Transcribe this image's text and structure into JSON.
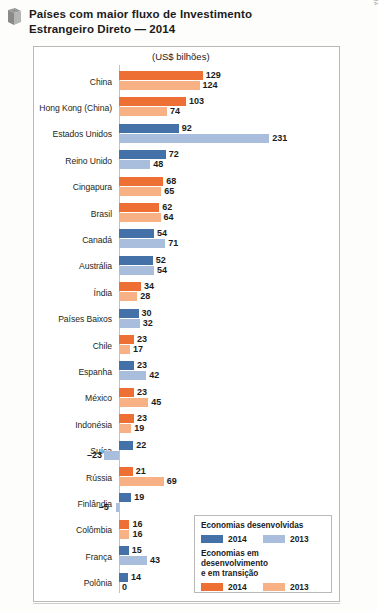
{
  "header": {
    "icon": "flag-bookmark-icon",
    "title_line1": "Países com maior fluxo de Investimento",
    "title_line2": "Estrangeiro Direto — 2014"
  },
  "credit": "FERNANDO JOSÉ FERREIRA",
  "colors": {
    "series_2014_developed": "#4472a8",
    "series_2013_developed": "#a9bedd",
    "series_2014_emerging": "#ed6f33",
    "series_2013_emerging": "#f8b185",
    "frame": "#b9b9b9",
    "axis": "#c2c2c2",
    "text": "#231f20"
  },
  "legend": {
    "group_developed": {
      "title": "Economias desenvolvidas",
      "items": [
        {
          "label": "2014",
          "color": "#4472a8"
        },
        {
          "label": "2013",
          "color": "#a9bedd"
        }
      ]
    },
    "group_emerging": {
      "title_line1": "Economias em desenvolvimento",
      "title_line2": "e em transição",
      "items": [
        {
          "label": "2014",
          "color": "#ed6f33"
        },
        {
          "label": "2013",
          "color": "#f8b185"
        }
      ]
    }
  },
  "chart_data": {
    "type": "bar",
    "orientation": "horizontal",
    "title": "Países com maior fluxo de Investimento Estrangeiro Direto — 2014",
    "units_caption": "(US$ bilhões)",
    "xlabel": "",
    "ylabel": "",
    "grid": false,
    "legend_position": "bottom-right",
    "xlim": [
      -23,
      231
    ],
    "axis_origin_value": 0,
    "px_per_unit": 0.65,
    "categories": [
      "China",
      "Hong Kong (China)",
      "Estados Unidos",
      "Reino Unido",
      "Cingapura",
      "Brasil",
      "Canadá",
      "Austrália",
      "Índia",
      "Países Baixos",
      "Chile",
      "Espanha",
      "México",
      "Indonésia",
      "Suíça",
      "Rússia",
      "Finlândia",
      "Colômbia",
      "França",
      "Polônia"
    ],
    "group_of_category": [
      "emerging",
      "emerging",
      "developed",
      "developed",
      "emerging",
      "emerging",
      "developed",
      "developed",
      "emerging",
      "developed",
      "emerging",
      "developed",
      "emerging",
      "emerging",
      "developed",
      "emerging",
      "developed",
      "emerging",
      "developed",
      "developed"
    ],
    "series": [
      {
        "name": "2014",
        "values": [
          129,
          103,
          92,
          72,
          68,
          62,
          54,
          52,
          34,
          30,
          23,
          23,
          23,
          23,
          22,
          21,
          19,
          16,
          15,
          14
        ],
        "labels": [
          "129",
          "103",
          "92",
          "72",
          "68",
          "62",
          "54",
          "52",
          "34",
          "30",
          "23",
          "23",
          "23",
          "23",
          "22",
          "21",
          "19",
          "16",
          "15",
          "14"
        ]
      },
      {
        "name": "2013",
        "values": [
          124,
          74,
          231,
          48,
          65,
          64,
          71,
          54,
          28,
          32,
          17,
          42,
          45,
          19,
          -23,
          69,
          -5,
          16,
          43,
          0
        ],
        "labels": [
          "124",
          "74",
          "231",
          "48",
          "65",
          "64",
          "71",
          "54",
          "28",
          "32",
          "17",
          "42",
          "45",
          "19",
          "–23",
          "69",
          "–5",
          "16",
          "43",
          "0"
        ]
      }
    ]
  }
}
